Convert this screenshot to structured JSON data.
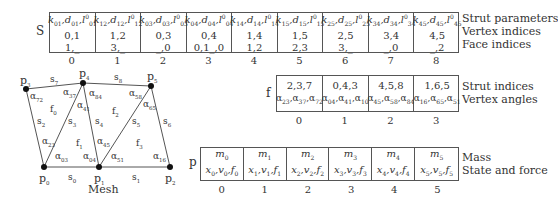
{
  "strut_table": {
    "label": "S",
    "row_labels": [
      "Strut parameters",
      "Vertex indices",
      "Face indices"
    ],
    "cells": [
      {
        "index": "0",
        "k": "01",
        "d": "01",
        "l": "01",
        "vertices": "0,1",
        "faces": "1,_"
      },
      {
        "index": "1",
        "k": "12",
        "d": "12",
        "l": "12",
        "vertices": "1,2",
        "faces": "3,_"
      },
      {
        "index": "2",
        "k": "03",
        "d": "03",
        "l": "03",
        "vertices": "0,3",
        "faces": "_,0"
      },
      {
        "index": "3",
        "k": "04",
        "d": "04",
        "l": "04",
        "vertices": "0,4",
        "faces": "0,1_,0"
      },
      {
        "index": "4",
        "k": "14",
        "d": "14",
        "l": "14",
        "vertices": "1,4",
        "faces": "1,2"
      },
      {
        "index": "5",
        "k": "15",
        "d": "15",
        "l": "15",
        "vertices": "1,5",
        "faces": "2,3"
      },
      {
        "index": "6",
        "k": "25",
        "d": "25",
        "l": "25",
        "vertices": "2,5",
        "faces": "3,_"
      },
      {
        "index": "7",
        "k": "34",
        "d": "34",
        "l": "34",
        "vertices": "3,4",
        "faces": "_,0"
      },
      {
        "index": "8",
        "k": "45",
        "d": "45",
        "l": "45",
        "vertices": "4,5",
        "faces": "_,2"
      }
    ]
  },
  "face_table": {
    "label": "f",
    "row_labels": [
      "Strut indices",
      "Vertex angles"
    ],
    "cells": [
      {
        "index": "0",
        "struts": "2,3,7",
        "angles": [
          "23",
          "37",
          "72"
        ]
      },
      {
        "index": "1",
        "struts": "0,4,3",
        "angles": [
          "04",
          "41",
          "10"
        ]
      },
      {
        "index": "2",
        "struts": "4,5,8",
        "angles": [
          "45",
          "58",
          "84"
        ]
      },
      {
        "index": "3",
        "struts": "1,6,5",
        "angles": [
          "16",
          "65",
          "51"
        ]
      }
    ]
  },
  "point_table": {
    "label": "p",
    "row_labels": [
      "Mass",
      "State and force"
    ],
    "cells": [
      {
        "index": "0",
        "sub": "0"
      },
      {
        "index": "1",
        "sub": "1"
      },
      {
        "index": "2",
        "sub": "2"
      },
      {
        "index": "3",
        "sub": "3"
      },
      {
        "index": "4",
        "sub": "4"
      },
      {
        "index": "5",
        "sub": "5"
      }
    ]
  },
  "mesh": {
    "caption": "Mesh",
    "vertices": [
      {
        "name": "p",
        "sub": "0",
        "x": 44,
        "y": 167
      },
      {
        "name": "p",
        "sub": "1",
        "x": 99,
        "y": 167
      },
      {
        "name": "p",
        "sub": "2",
        "x": 170,
        "y": 167
      },
      {
        "name": "p",
        "sub": "3",
        "x": 26,
        "y": 89
      },
      {
        "name": "p",
        "sub": "4",
        "x": 83,
        "y": 83
      },
      {
        "name": "p",
        "sub": "5",
        "x": 151,
        "y": 86
      }
    ],
    "struts": [
      {
        "name": "s",
        "sub": "0"
      },
      {
        "name": "s",
        "sub": "1"
      },
      {
        "name": "s",
        "sub": "2"
      },
      {
        "name": "s",
        "sub": "3"
      },
      {
        "name": "s",
        "sub": "4"
      },
      {
        "name": "s",
        "sub": "5"
      },
      {
        "name": "s",
        "sub": "6"
      },
      {
        "name": "s",
        "sub": "7"
      },
      {
        "name": "s",
        "sub": "8"
      }
    ],
    "faces": [
      {
        "name": "f",
        "sub": "0"
      },
      {
        "name": "f",
        "sub": "1"
      },
      {
        "name": "f",
        "sub": "2"
      },
      {
        "name": "f",
        "sub": "3"
      }
    ],
    "angles": [
      "72",
      "37",
      "84",
      "58",
      "23",
      "03",
      "41",
      "04",
      "45",
      "51",
      "65",
      "16"
    ]
  }
}
